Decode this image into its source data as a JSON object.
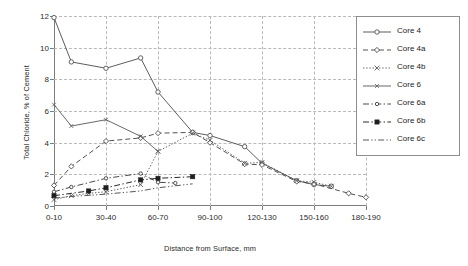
{
  "chart_data": {
    "type": "line",
    "title": "",
    "xlabel": "Distance from Surface, mm",
    "ylabel": "Total Chloride, % of Cement",
    "categories": [
      "0-10",
      "10-20",
      "20-30",
      "30-40",
      "40-50",
      "50-60",
      "60-70",
      "70-80",
      "80-90",
      "90-100",
      "100-110",
      "110-120",
      "120-130",
      "130-140",
      "140-150",
      "150-160",
      "160-170",
      "170-180",
      "180-190"
    ],
    "xtick_labels": [
      "0-10",
      "30-40",
      "60-70",
      "90-100",
      "120-130",
      "150-160",
      "180-190"
    ],
    "xtick_indices": [
      0,
      3,
      6,
      9,
      12,
      15,
      18
    ],
    "ytick_labels": [
      "0",
      "2",
      "4",
      "6",
      "8",
      "10",
      "12"
    ],
    "ylim": [
      0,
      12
    ],
    "xlim": [
      0,
      18
    ],
    "grid": true,
    "legend_position": "top-right",
    "series": [
      {
        "name": "Core 4",
        "style": "solid",
        "marker": "open-circle",
        "color": "#545454",
        "x": [
          0,
          1,
          3,
          5,
          6,
          8,
          9,
          11,
          12,
          14,
          15,
          16
        ],
        "values": [
          11.9,
          9.1,
          8.7,
          9.35,
          7.2,
          4.65,
          4.45,
          3.75,
          2.7,
          1.6,
          1.35,
          1.25
        ]
      },
      {
        "name": "Core 4a",
        "style": "dashed",
        "marker": "open-diamond",
        "color": "#4a4a4a",
        "x": [
          0,
          1,
          3,
          5,
          6,
          8,
          9,
          11,
          12,
          14,
          15,
          17,
          18
        ],
        "values": [
          1.3,
          2.5,
          4.1,
          4.3,
          4.6,
          4.65,
          4.0,
          2.65,
          2.6,
          1.55,
          1.4,
          0.8,
          0.55
        ]
      },
      {
        "name": "Core 4b",
        "style": "dotted",
        "marker": "cross",
        "color": "#5a5a5a",
        "x": [
          0,
          1,
          2,
          3,
          5,
          6,
          8,
          9,
          11,
          12,
          14,
          15,
          16
        ],
        "values": [
          0.4,
          0.65,
          0.8,
          0.9,
          1.35,
          3.45,
          4.6,
          4.15,
          2.7,
          2.75,
          1.6,
          1.5,
          1.25
        ]
      },
      {
        "name": "Core 6",
        "style": "solid",
        "marker": "small-cross",
        "color": "#606060",
        "x": [
          0,
          1,
          3,
          5,
          6
        ],
        "values": [
          6.4,
          5.05,
          5.45,
          4.4,
          3.45
        ]
      },
      {
        "name": "Core 6a",
        "style": "dash-dot",
        "marker": "open-circle-small",
        "color": "#3f3f3f",
        "x": [
          0,
          1,
          3,
          5,
          6,
          7
        ],
        "values": [
          0.9,
          1.2,
          1.75,
          2.05,
          1.5,
          1.45
        ]
      },
      {
        "name": "Core 6b",
        "style": "dash-dot",
        "marker": "filled-square",
        "color": "#1f1f1f",
        "x": [
          0,
          2,
          3,
          5,
          6,
          8
        ],
        "values": [
          0.65,
          0.95,
          1.15,
          1.65,
          1.75,
          1.85
        ]
      },
      {
        "name": "Core 6c",
        "style": "dash-dot-dot",
        "marker": "none",
        "color": "#4f4f4f",
        "x": [
          0,
          1,
          3,
          5,
          6,
          8
        ],
        "values": [
          0.5,
          0.6,
          0.75,
          0.95,
          1.15,
          1.4
        ]
      }
    ]
  }
}
